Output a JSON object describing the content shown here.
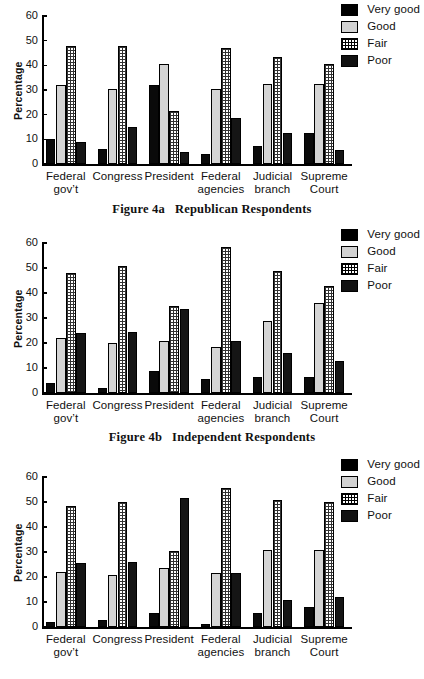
{
  "legend": {
    "items": [
      {
        "label": "Very good",
        "swatch": "verygood-swatch-icon",
        "color": "#000000"
      },
      {
        "label": "Good",
        "swatch": "good-swatch-icon",
        "color": "#d2d2d2"
      },
      {
        "label": "Fair",
        "swatch": "fair-swatch-icon",
        "color": "#ffffff"
      },
      {
        "label": "Poor",
        "swatch": "poor-swatch-icon",
        "color": "#111111"
      }
    ]
  },
  "axis": {
    "ylabel": "Percentage",
    "yticks": [
      "60",
      "50",
      "40",
      "30",
      "20",
      "10",
      "0"
    ],
    "ymin": 0,
    "ymax": 60
  },
  "categories": [
    "Federal gov’t",
    "Congress",
    "President",
    "Federal\nagencies",
    "Judicial\nbranch",
    "Supreme Court"
  ],
  "captions": [
    {
      "number": "Figure 4a",
      "title": "Republican Respondents"
    },
    {
      "number": "Figure 4b",
      "title": "Independent Respondents"
    }
  ],
  "chart_data": [
    {
      "type": "bar",
      "title": "Figure 4a  Republican Respondents",
      "xlabel": "",
      "ylabel": "Percentage",
      "ylim": [
        0,
        60
      ],
      "grid": false,
      "legend_position": "top-right",
      "categories": [
        "Federal gov’t",
        "Congress",
        "President",
        "Federal agencies",
        "Judicial branch",
        "Supreme Court"
      ],
      "series": [
        {
          "name": "Very good",
          "values": [
            10,
            6,
            32,
            4,
            7.5,
            12.5
          ]
        },
        {
          "name": "Good",
          "values": [
            32,
            30.5,
            40.5,
            30.5,
            32.5,
            32.5
          ]
        },
        {
          "name": "Fair",
          "values": [
            48,
            48,
            21.5,
            47,
            43.5,
            40.5
          ]
        },
        {
          "name": "Poor",
          "values": [
            9,
            15,
            5,
            18.5,
            12.5,
            5.5
          ]
        }
      ]
    },
    {
      "type": "bar",
      "title": "Figure 4b  Independent Respondents",
      "xlabel": "",
      "ylabel": "Percentage",
      "ylim": [
        0,
        60
      ],
      "grid": false,
      "legend_position": "top-right",
      "categories": [
        "Federal gov’t",
        "Congress",
        "President",
        "Federal agencies",
        "Judicial branch",
        "Supreme Court"
      ],
      "series": [
        {
          "name": "Very good",
          "values": [
            4,
            2,
            9,
            5.5,
            6.5,
            6.5
          ]
        },
        {
          "name": "Good",
          "values": [
            22,
            20,
            21,
            18.5,
            29,
            36
          ]
        },
        {
          "name": "Fair",
          "values": [
            48,
            51,
            35,
            58.5,
            49,
            43
          ]
        },
        {
          "name": "Poor",
          "values": [
            24,
            24.5,
            33.5,
            21,
            16,
            13
          ]
        }
      ]
    },
    {
      "type": "bar",
      "title": "",
      "xlabel": "",
      "ylabel": "Percentage",
      "ylim": [
        0,
        60
      ],
      "grid": false,
      "legend_position": "top-right",
      "categories": [
        "Federal gov’t",
        "Congress",
        "President",
        "Federal agencies",
        "Judicial branch",
        "Supreme Court"
      ],
      "series": [
        {
          "name": "Very good",
          "values": [
            2,
            3,
            5.5,
            1.3,
            5.5,
            8
          ]
        },
        {
          "name": "Good",
          "values": [
            22,
            21,
            23.5,
            21.5,
            31,
            31
          ]
        },
        {
          "name": "Fair",
          "values": [
            48.5,
            50,
            30.5,
            55.5,
            51,
            50
          ]
        },
        {
          "name": "Poor",
          "values": [
            25.5,
            26,
            51.5,
            21.5,
            11,
            12
          ]
        }
      ]
    }
  ]
}
